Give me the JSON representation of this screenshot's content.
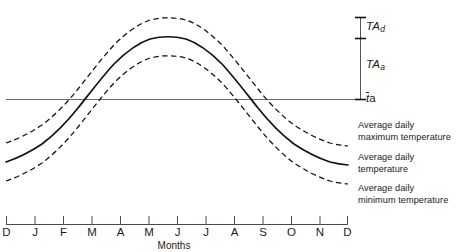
{
  "chart_data": {
    "type": "line",
    "title": "",
    "subtitle": "",
    "xlabel": "Months",
    "ylabel": "",
    "grid": false,
    "legend_position": "right",
    "categories": [
      "D",
      "J",
      "F",
      "M",
      "A",
      "M",
      "J",
      "J",
      "A",
      "S",
      "O",
      "N",
      "D"
    ],
    "x": [
      0,
      1,
      2,
      3,
      4,
      5,
      6,
      7,
      8,
      9,
      10,
      11,
      12
    ],
    "xlim": [
      0,
      12
    ],
    "ylim": [
      -1.35,
      1.55
    ],
    "series": [
      {
        "name": "Average daily maximum temperature",
        "style": "dashed",
        "values": [
          -0.62,
          -0.3,
          0.14,
          0.62,
          1.02,
          1.27,
          1.36,
          1.27,
          1.02,
          0.62,
          0.14,
          -0.3,
          -0.62
        ]
      },
      {
        "name": "Average daily temperature",
        "style": "solid",
        "values": [
          -0.94,
          -0.62,
          -0.18,
          0.3,
          0.7,
          0.95,
          1.04,
          0.95,
          0.7,
          0.3,
          -0.18,
          -0.62,
          -0.94
        ]
      },
      {
        "name": "Average daily minimum temperature",
        "style": "dashed",
        "values": [
          -1.25,
          -0.93,
          -0.49,
          -0.01,
          0.39,
          0.64,
          0.73,
          0.64,
          0.39,
          -0.01,
          -0.49,
          -0.93,
          -1.25
        ]
      }
    ],
    "reference_line": {
      "name": "annual mean air temperature",
      "label": "t_a",
      "value": 0.0,
      "style": "solid"
    },
    "annotations": [
      {
        "name": "TA_d",
        "label": "TA",
        "subscript": "d",
        "description": "daily temperature amplitude",
        "from_value": 1.04,
        "to_value": 1.36
      },
      {
        "name": "TA_a",
        "label": "TA",
        "subscript": "a",
        "description": "annual temperature amplitude",
        "from_value": 0.0,
        "to_value": 1.04
      },
      {
        "name": "t_a_bar",
        "label": "t",
        "subscript": "a",
        "overbar": true,
        "description": "mean annual air temperature",
        "value": 0.0
      }
    ]
  },
  "axis": {
    "x_title": "Months",
    "tick_labels": [
      "D",
      "J",
      "F",
      "M",
      "A",
      "M",
      "J",
      "J",
      "A",
      "S",
      "O",
      "N",
      "D"
    ]
  },
  "scale_bar": {
    "ta_d": {
      "label": "TA",
      "subscript": "d"
    },
    "ta_a": {
      "label": "TA",
      "subscript": "a"
    },
    "t_a": {
      "label": "t",
      "subscript": "a"
    }
  },
  "legend": {
    "max": {
      "line1": "Average daily",
      "line2": "maximum temperature"
    },
    "avg": {
      "line1": "Average daily",
      "line2": "temperature"
    },
    "min": {
      "line1": "Average daily",
      "line2": "minimum temperature"
    }
  },
  "colors": {
    "curve": "#111111",
    "reference_line": "#6b6b6b",
    "axis": "#4a4a4a",
    "text": "#1a1a1a",
    "background": "#ffffff"
  }
}
